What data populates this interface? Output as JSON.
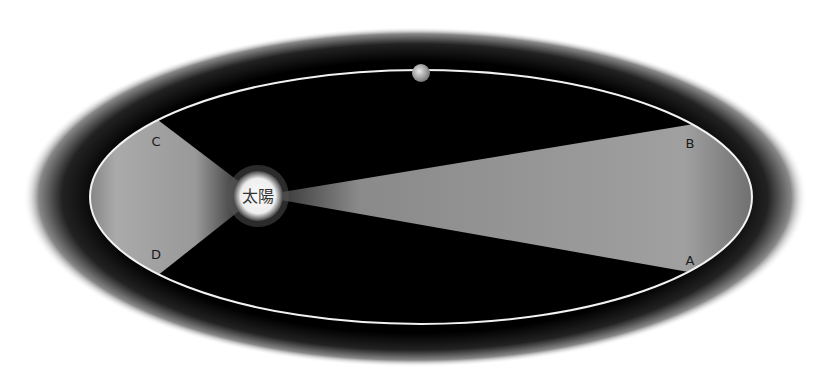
{
  "diagram": {
    "sun": {
      "label": "太陽",
      "cx": 258,
      "cy": 196,
      "r": 25
    },
    "planet": {
      "cx": 421,
      "cy": 73,
      "r": 9
    },
    "orbit": {
      "cx": 421,
      "cy": 197,
      "rx": 331,
      "ry": 127,
      "stroke": "#f2f2f2"
    },
    "halo": {
      "cx": 415,
      "cy": 197,
      "rx": 390,
      "ry": 168
    },
    "points": [
      {
        "id": "A",
        "label": "A",
        "x": 697,
        "y": 272
      },
      {
        "id": "B",
        "label": "B",
        "x": 694,
        "y": 125
      },
      {
        "id": "C",
        "label": "C",
        "x": 158,
        "y": 123
      },
      {
        "id": "D",
        "label": "D",
        "x": 157,
        "y": 272
      }
    ],
    "colors": {
      "background": "#ffffff",
      "space": "#000000",
      "sector": "#9a9a9a",
      "sun": "#f4f4f4",
      "label": "#1a1a1a"
    }
  }
}
